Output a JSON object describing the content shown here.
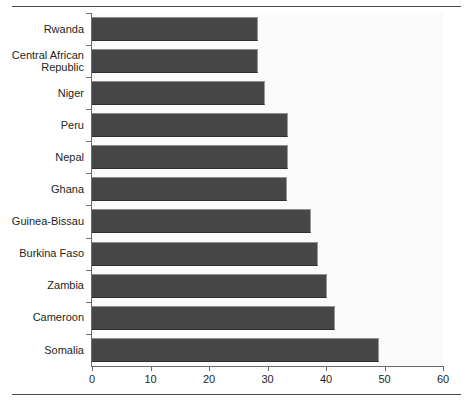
{
  "chart_data": {
    "type": "bar",
    "orientation": "horizontal",
    "title": "",
    "subtitle": "",
    "xlabel": "",
    "ylabel": "",
    "xlim": [
      0,
      60
    ],
    "xticks": [
      0,
      10,
      20,
      30,
      40,
      50,
      60
    ],
    "xtick_labels": [
      "0",
      "10",
      "20",
      "30",
      "40",
      "50",
      "60"
    ],
    "grid": false,
    "legend": null,
    "bar_color": "#474747",
    "plot_background": "#fbfbfb",
    "axis_color": "#6b6b6b",
    "categories": [
      "Rwanda",
      "Central African\nRepublic",
      "Niger",
      "Peru",
      "Nepal",
      "Ghana",
      "Guinea-Bissau",
      "Burkina Faso",
      "Zambia",
      "Cameroon",
      "Somalia"
    ],
    "values": [
      28.4,
      28.4,
      29.6,
      33.5,
      33.5,
      33.4,
      37.4,
      38.7,
      40.2,
      41.5,
      49.0
    ]
  }
}
